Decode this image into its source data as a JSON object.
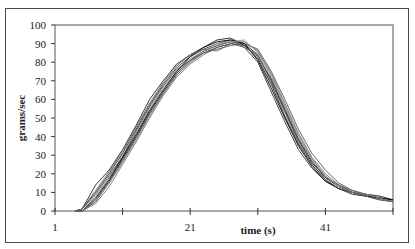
{
  "chart_data": {
    "type": "line",
    "title": "",
    "xlabel": "time (s)",
    "ylabel": "grams/sec",
    "xlim": [
      1,
      51
    ],
    "ylim": [
      0,
      100
    ],
    "x_tick_labels": [
      "1",
      "21",
      "41"
    ],
    "x_tick_positions": [
      1,
      11,
      21,
      31,
      41,
      51
    ],
    "y_ticks": [
      0,
      10,
      20,
      30,
      40,
      50,
      60,
      70,
      80,
      90,
      100
    ],
    "grid": false,
    "legend": null,
    "x": [
      5,
      7,
      9,
      11,
      13,
      15,
      17,
      19,
      21,
      23,
      25,
      27,
      29,
      31,
      33,
      35,
      37,
      39,
      41,
      43,
      45,
      47,
      49,
      51
    ],
    "series": [
      {
        "name": "trial 1",
        "values": [
          0,
          6,
          16,
          28,
          40,
          53,
          64,
          74,
          81,
          86,
          89,
          91,
          90,
          84,
          70,
          54,
          38,
          26,
          18,
          13,
          10,
          9,
          7,
          6
        ]
      },
      {
        "name": "trial 2",
        "values": [
          1,
          10,
          20,
          31,
          44,
          57,
          68,
          77,
          83,
          87,
          90,
          92,
          88,
          80,
          64,
          48,
          33,
          23,
          16,
          12,
          10,
          8,
          7,
          5
        ]
      },
      {
        "name": "trial 3",
        "values": [
          0,
          4,
          13,
          25,
          37,
          50,
          62,
          72,
          79,
          84,
          88,
          90,
          91,
          86,
          74,
          58,
          42,
          29,
          20,
          14,
          11,
          9,
          8,
          6
        ]
      },
      {
        "name": "trial 4",
        "values": [
          1,
          14,
          22,
          33,
          46,
          60,
          70,
          79,
          84,
          88,
          92,
          93,
          89,
          82,
          68,
          51,
          36,
          25,
          17,
          12,
          9,
          8,
          6,
          5
        ]
      },
      {
        "name": "trial 5",
        "values": [
          0,
          8,
          18,
          30,
          42,
          55,
          66,
          75,
          82,
          86,
          90,
          91,
          92,
          85,
          72,
          56,
          40,
          28,
          19,
          13,
          11,
          9,
          7,
          5
        ]
      },
      {
        "name": "trial 6",
        "values": [
          0,
          5,
          15,
          27,
          39,
          52,
          63,
          73,
          80,
          85,
          88,
          90,
          89,
          83,
          71,
          55,
          39,
          27,
          18,
          14,
          10,
          9,
          8,
          6
        ]
      },
      {
        "name": "trial 7",
        "values": [
          1,
          9,
          19,
          29,
          43,
          56,
          67,
          76,
          81,
          85,
          87,
          89,
          90,
          87,
          75,
          60,
          44,
          31,
          22,
          15,
          11,
          9,
          7,
          5
        ]
      },
      {
        "name": "trial 8",
        "values": [
          0,
          7,
          17,
          29,
          41,
          54,
          65,
          75,
          83,
          88,
          91,
          92,
          90,
          81,
          66,
          50,
          35,
          24,
          16,
          12,
          10,
          8,
          7,
          6
        ]
      },
      {
        "name": "trial 9",
        "values": [
          0,
          6,
          15,
          26,
          38,
          51,
          63,
          73,
          80,
          86,
          89,
          91,
          91,
          86,
          73,
          57,
          41,
          28,
          19,
          13,
          10,
          9,
          7,
          5
        ]
      },
      {
        "name": "trial 10",
        "values": [
          1,
          11,
          21,
          32,
          45,
          58,
          69,
          78,
          84,
          87,
          86,
          90,
          88,
          84,
          69,
          53,
          37,
          25,
          17,
          12,
          10,
          8,
          6,
          5
        ]
      }
    ]
  }
}
